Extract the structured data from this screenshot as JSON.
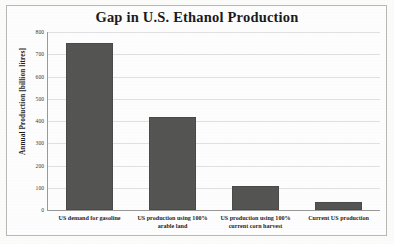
{
  "chart_data": {
    "type": "bar",
    "title": "Gap in U.S. Ethanol Production",
    "xlabel": "",
    "ylabel": "Annual Production [billion litres]",
    "ylim": [
      0,
      800
    ],
    "ytick_step": 100,
    "yticks": [
      800,
      700,
      600,
      500,
      400,
      300,
      200,
      100,
      0
    ],
    "grid": true,
    "legend": "none",
    "bar_color": "#555553",
    "categories": [
      "US demand for gasoline",
      "US production using 100% arable land",
      "US production using 100% current corn harvest",
      "Current US production"
    ],
    "category_lines": [
      [
        "US demand for gasoline"
      ],
      [
        "US production using 100%",
        "arable land"
      ],
      [
        "US production using 100%",
        "current corn harvest"
      ],
      [
        "Current US production"
      ]
    ],
    "values": [
      750,
      420,
      110,
      35
    ]
  }
}
